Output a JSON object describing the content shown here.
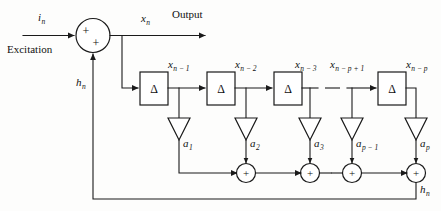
{
  "diagram": {
    "type": "signal-flow-block-diagram",
    "colors": {
      "line": "#1a1a1a",
      "fill": "#ffffff",
      "background": "#fdfdfc",
      "text": "#111111"
    },
    "labels": {
      "input_signal": "i",
      "input_signal_sub": "n",
      "excitation": "Excitation",
      "output_signal": "x",
      "output_signal_sub": "n",
      "output_word": "Output",
      "feedback_signal_left": "h",
      "feedback_signal_left_sub": "n",
      "feedback_signal_right": "h",
      "feedback_signal_right_sub": "n",
      "delta": "Δ",
      "plus": "+"
    },
    "summing_junction": {
      "name": "input-summing-junction",
      "plus_top": "+",
      "plus_bottom": "+"
    },
    "delay_blocks": [
      {
        "id": "delay-1",
        "glyph": "Δ",
        "tap_label_base": "x",
        "tap_label_sub": "n − 1"
      },
      {
        "id": "delay-2",
        "glyph": "Δ",
        "tap_label_base": "x",
        "tap_label_sub": "n − 2"
      },
      {
        "id": "delay-3",
        "glyph": "Δ",
        "tap_label_base": "x",
        "tap_label_sub": "n − 3"
      },
      {
        "id": "delay-p",
        "glyph": "Δ",
        "tap_label_base": "x",
        "tap_label_sub": "n − p"
      }
    ],
    "intermediate_tap": {
      "id": "tap-p-minus-1",
      "label_base": "x",
      "label_sub": "n − p + 1"
    },
    "coefficients": [
      {
        "id": "gain-a1",
        "base": "a",
        "sub": "1"
      },
      {
        "id": "gain-a2",
        "base": "a",
        "sub": "2"
      },
      {
        "id": "gain-a3",
        "base": "a",
        "sub": "3"
      },
      {
        "id": "gain-ap-1",
        "base": "a",
        "sub": "p − 1"
      },
      {
        "id": "gain-ap",
        "base": "a",
        "sub": "p"
      }
    ],
    "adders": [
      {
        "id": "adder-1",
        "glyph": "+"
      },
      {
        "id": "adder-2",
        "glyph": "+"
      },
      {
        "id": "adder-3",
        "glyph": "+"
      },
      {
        "id": "adder-4",
        "glyph": "+"
      }
    ],
    "ellipsis_marks": {
      "tap_row": "—",
      "adder_row": "—"
    }
  }
}
